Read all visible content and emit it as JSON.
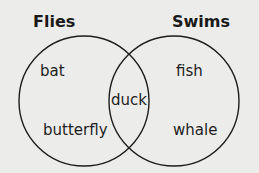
{
  "diagram": {
    "type": "venn",
    "sets": [
      {
        "title": "Flies",
        "only_items": [
          "bat",
          "butterfly"
        ]
      },
      {
        "title": "Swims",
        "only_items": [
          "fish",
          "whale"
        ]
      }
    ],
    "intersection": [
      "duck"
    ],
    "colors": {
      "background": "#ececea",
      "stroke": "#1e1e1e"
    }
  }
}
